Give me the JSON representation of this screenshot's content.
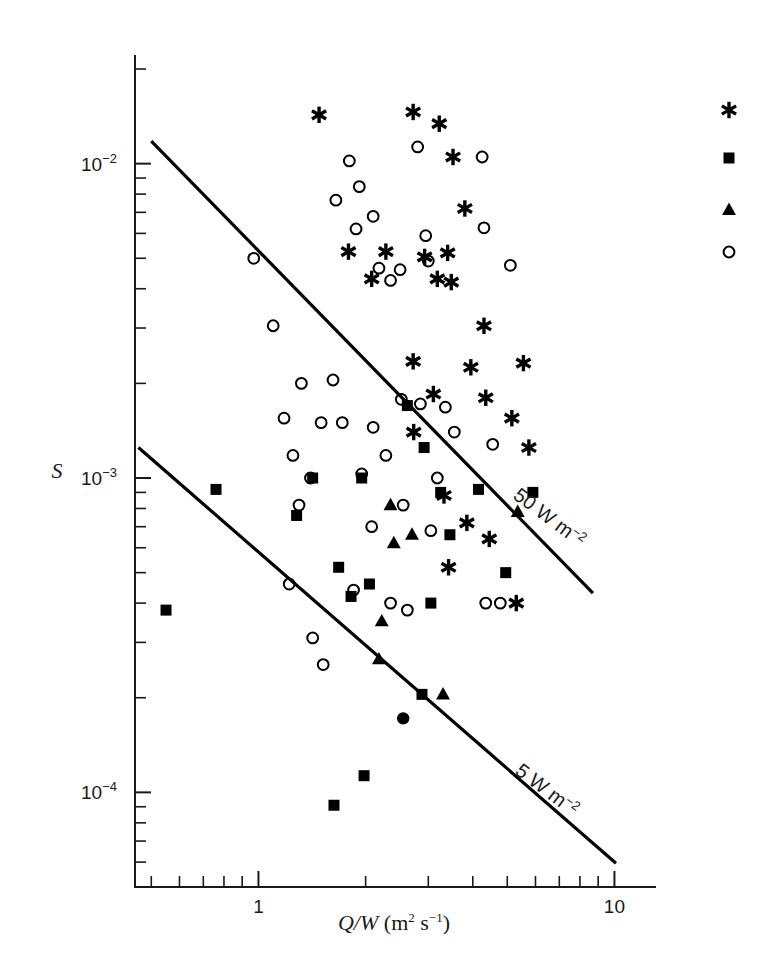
{
  "chart_data": {
    "type": "scatter",
    "title": "",
    "subtitle": "",
    "xlabel": "Q/W (m² s⁻¹)",
    "ylabel": "S",
    "xscale": "log",
    "yscale": "log",
    "xlim": [
      0.45,
      13.0
    ],
    "ylim": [
      5e-05,
      0.022
    ],
    "grid": false,
    "legend_position": "top-right",
    "xticks": [
      {
        "value": 1,
        "label": "1",
        "major": true
      },
      {
        "value": 10,
        "label": "10",
        "major": true
      }
    ],
    "yticks": [
      {
        "value": 0.01,
        "label": "10⁻²",
        "major": true
      },
      {
        "value": 0.001,
        "label": "10⁻³",
        "major": true
      },
      {
        "value": 0.0001,
        "label": "10⁻⁴",
        "major": true
      }
    ],
    "xtick_labels": [
      "1",
      "10"
    ],
    "ytick_labels": [
      "10⁻²",
      "10⁻³",
      "10⁻⁴"
    ],
    "annotations": [
      {
        "text": "50 W m⁻²",
        "rotation": 37,
        "x": 6.4,
        "y": 0.00072
      },
      {
        "text": "5 W m⁻²",
        "rotation": 37,
        "x": 6.3,
        "y": 9.8e-05
      }
    ],
    "reference_lines": [
      {
        "label": "50 W m⁻²",
        "x1": 0.5,
        "y1": 0.0118,
        "x2": 8.7,
        "y2": 0.00043
      },
      {
        "label": "5 W m⁻²",
        "x1": 0.46,
        "y1": 0.00125,
        "x2": 10.1,
        "y2": 5.95e-05
      }
    ],
    "legend": [
      {
        "marker": "asterisk",
        "label": ""
      },
      {
        "marker": "square",
        "label": ""
      },
      {
        "marker": "triangle",
        "label": ""
      },
      {
        "marker": "circle-open",
        "label": ""
      }
    ],
    "series": [
      {
        "name": "asterisk",
        "marker": "asterisk",
        "color": "#000000",
        "points": [
          [
            1.48,
            0.0143
          ],
          [
            2.72,
            0.0146
          ],
          [
            3.22,
            0.0134
          ],
          [
            3.52,
            0.0105
          ],
          [
            3.8,
            0.0072
          ],
          [
            1.79,
            0.00525
          ],
          [
            2.28,
            0.00525
          ],
          [
            2.93,
            0.00505
          ],
          [
            3.4,
            0.0052
          ],
          [
            2.08,
            0.0043
          ],
          [
            3.18,
            0.0043
          ],
          [
            3.48,
            0.0042
          ],
          [
            4.3,
            0.00305
          ],
          [
            2.72,
            0.00235
          ],
          [
            3.95,
            0.00225
          ],
          [
            5.55,
            0.00232
          ],
          [
            3.1,
            0.00185
          ],
          [
            4.35,
            0.0018
          ],
          [
            5.15,
            0.00155
          ],
          [
            2.73,
            0.0014
          ],
          [
            5.75,
            0.00125
          ],
          [
            3.32,
            0.00088
          ],
          [
            3.85,
            0.00072
          ],
          [
            4.45,
            0.00064
          ],
          [
            3.42,
            0.00052
          ],
          [
            5.3,
            0.0004
          ]
        ]
      },
      {
        "name": "square",
        "marker": "square",
        "color": "#000000",
        "points": [
          [
            2.62,
            0.0017
          ],
          [
            2.92,
            0.00125
          ],
          [
            0.76,
            0.00092
          ],
          [
            1.42,
            0.001
          ],
          [
            1.95,
            0.001
          ],
          [
            3.25,
            0.0009
          ],
          [
            4.15,
            0.00092
          ],
          [
            5.9,
            0.0009
          ],
          [
            1.28,
            0.00076
          ],
          [
            3.45,
            0.00066
          ],
          [
            0.55,
            0.00038
          ],
          [
            1.68,
            0.00052
          ],
          [
            2.05,
            0.00046
          ],
          [
            1.82,
            0.00042
          ],
          [
            3.05,
            0.0004
          ],
          [
            4.95,
            0.0005
          ],
          [
            2.88,
            0.000205
          ],
          [
            1.98,
            0.000113
          ],
          [
            1.63,
            9.1e-05
          ]
        ]
      },
      {
        "name": "triangle",
        "marker": "triangle",
        "color": "#000000",
        "points": [
          [
            2.35,
            0.00082
          ],
          [
            5.35,
            0.00078
          ],
          [
            2.7,
            0.00066
          ],
          [
            2.4,
            0.00062
          ],
          [
            2.22,
            0.00035
          ],
          [
            2.18,
            0.000265
          ],
          [
            3.3,
            0.000205
          ]
        ]
      },
      {
        "name": "circle-open",
        "marker": "circle-open",
        "color": "#000000",
        "points": [
          [
            1.8,
            0.0102
          ],
          [
            2.8,
            0.0113
          ],
          [
            4.25,
            0.0105
          ],
          [
            1.92,
            0.00845
          ],
          [
            1.65,
            0.00765
          ],
          [
            2.1,
            0.0068
          ],
          [
            1.88,
            0.0062
          ],
          [
            2.95,
            0.0059
          ],
          [
            4.3,
            0.00625
          ],
          [
            3.0,
            0.0049
          ],
          [
            2.18,
            0.00465
          ],
          [
            2.5,
            0.0046
          ],
          [
            2.35,
            0.00425
          ],
          [
            5.1,
            0.00475
          ],
          [
            0.97,
            0.005
          ],
          [
            1.1,
            0.00305
          ],
          [
            1.32,
            0.002
          ],
          [
            1.62,
            0.00205
          ],
          [
            2.52,
            0.00178
          ],
          [
            2.85,
            0.00172
          ],
          [
            3.35,
            0.00168
          ],
          [
            1.18,
            0.00155
          ],
          [
            1.5,
            0.0015
          ],
          [
            1.72,
            0.0015
          ],
          [
            2.1,
            0.00145
          ],
          [
            3.55,
            0.0014
          ],
          [
            4.55,
            0.00128
          ],
          [
            1.25,
            0.00118
          ],
          [
            2.28,
            0.00118
          ],
          [
            1.4,
            0.001
          ],
          [
            1.95,
            0.00103
          ],
          [
            3.18,
            0.001
          ],
          [
            1.3,
            0.00082
          ],
          [
            2.55,
            0.00082
          ],
          [
            2.08,
            0.0007
          ],
          [
            3.05,
            0.00068
          ],
          [
            1.22,
            0.00046
          ],
          [
            1.85,
            0.00044
          ],
          [
            2.35,
            0.0004
          ],
          [
            4.35,
            0.0004
          ],
          [
            4.78,
            0.0004
          ],
          [
            1.42,
            0.00031
          ],
          [
            2.62,
            0.00038
          ],
          [
            1.52,
            0.000255
          ]
        ]
      },
      {
        "name": "circle-filled",
        "marker": "circle-filled",
        "color": "#000000",
        "points": [
          [
            2.55,
            0.000172
          ]
        ]
      }
    ]
  }
}
